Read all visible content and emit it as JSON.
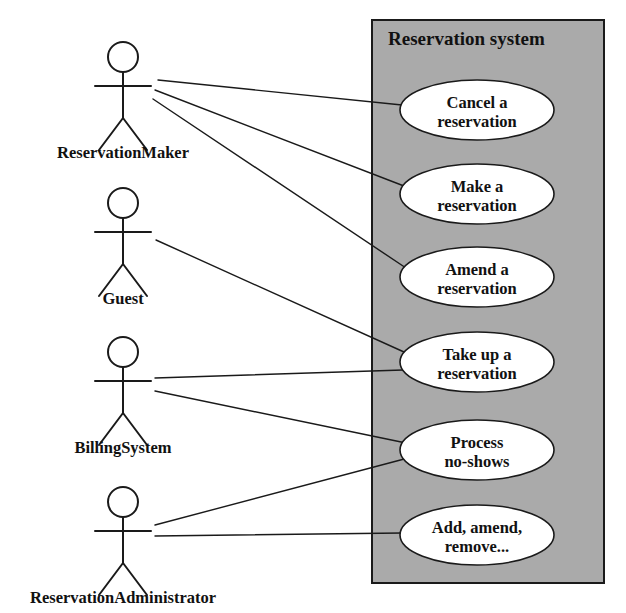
{
  "diagram": {
    "type": "uml-use-case-diagram",
    "canvas": {
      "width": 626,
      "height": 613,
      "background": "#ffffff"
    },
    "colors": {
      "system_fill": "#aaaaaa",
      "usecase_fill": "#ffffff",
      "stroke": "#1a1a1a",
      "text": "#111111"
    }
  },
  "system": {
    "title": "Reservation system",
    "title_x": 388,
    "title_y": 45,
    "box": {
      "x": 372,
      "y": 20,
      "width": 232,
      "height": 563
    }
  },
  "use_cases": [
    {
      "id": "cancel",
      "line1": "Cancel a",
      "line2": "reservation",
      "cx": 477,
      "cy": 110,
      "rx": 77,
      "ry": 30
    },
    {
      "id": "make",
      "line1": "Make a",
      "line2": "reservation",
      "cx": 477,
      "cy": 194,
      "rx": 77,
      "ry": 30
    },
    {
      "id": "amend",
      "line1": "Amend a",
      "line2": "reservation",
      "cx": 477,
      "cy": 277,
      "rx": 77,
      "ry": 30
    },
    {
      "id": "takeup",
      "line1": "Take up a",
      "line2": "reservation",
      "cx": 477,
      "cy": 362,
      "rx": 77,
      "ry": 30
    },
    {
      "id": "noshow",
      "line1": "Process",
      "line2": "no-shows",
      "cx": 477,
      "cy": 450,
      "rx": 77,
      "ry": 30
    },
    {
      "id": "admin",
      "line1": "Add, amend,",
      "line2": "remove...",
      "cx": 477,
      "cy": 535,
      "rx": 77,
      "ry": 30
    }
  ],
  "actors": [
    {
      "id": "reservation-maker",
      "label": "ReservationMaker",
      "x": 123,
      "y": 42,
      "label_y": 158
    },
    {
      "id": "guest",
      "label": "Guest",
      "x": 123,
      "y": 188,
      "label_y": 304
    },
    {
      "id": "billing-system",
      "label": "BillingSystem",
      "x": 123,
      "y": 337,
      "label_y": 453
    },
    {
      "id": "reservation-administrator",
      "label": "ReservationAdministrator",
      "x": 123,
      "y": 487,
      "label_y": 603
    }
  ],
  "associations": [
    {
      "id": "rm-cancel",
      "from": "reservation-maker",
      "to": "cancel",
      "x1": 158,
      "y1": 80,
      "x2": 402,
      "y2": 105
    },
    {
      "id": "rm-make",
      "from": "reservation-maker",
      "to": "make",
      "x1": 155,
      "y1": 90,
      "x2": 404,
      "y2": 186
    },
    {
      "id": "rm-amend",
      "from": "reservation-maker",
      "to": "amend",
      "x1": 153,
      "y1": 99,
      "x2": 406,
      "y2": 268
    },
    {
      "id": "guest-takeup",
      "from": "guest",
      "to": "takeup",
      "x1": 156,
      "y1": 240,
      "x2": 404,
      "y2": 352
    },
    {
      "id": "bs-takeup",
      "from": "billing-system",
      "to": "takeup",
      "x1": 155,
      "y1": 378,
      "x2": 403,
      "y2": 370
    },
    {
      "id": "bs-noshow",
      "from": "billing-system",
      "to": "noshow",
      "x1": 155,
      "y1": 391,
      "x2": 406,
      "y2": 443
    },
    {
      "id": "ra-noshow",
      "from": "reservation-administrator",
      "to": "noshow",
      "x1": 155,
      "y1": 525,
      "x2": 408,
      "y2": 458
    },
    {
      "id": "ra-admin",
      "from": "reservation-administrator",
      "to": "admin",
      "x1": 155,
      "y1": 536,
      "x2": 402,
      "y2": 533
    }
  ]
}
